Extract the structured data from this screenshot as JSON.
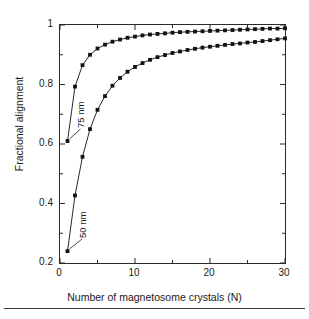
{
  "chart_data": {
    "type": "line",
    "title": "",
    "xlabel": "Number of magnetosome crystals (N)",
    "ylabel": "Fractional alignment",
    "xlim": [
      0,
      30
    ],
    "ylim": [
      0.2,
      1.0
    ],
    "grid": false,
    "legend_position": "inline-annotations",
    "xticks": [
      0,
      10,
      20,
      30
    ],
    "xtick_labels": [
      "0",
      "10",
      "20",
      "30"
    ],
    "xminor_ticks": [
      5,
      15,
      25
    ],
    "yticks": [
      0.2,
      0.4,
      0.6,
      0.8,
      1.0
    ],
    "ytick_labels": [
      "0.2",
      "0.4",
      "0.6",
      "0.8",
      "1"
    ],
    "yminor_ticks": [
      0.3,
      0.5,
      0.7,
      0.9
    ],
    "marker": "filled-square",
    "x": [
      1,
      2,
      3,
      4,
      5,
      6,
      7,
      8,
      9,
      10,
      11,
      12,
      13,
      14,
      15,
      16,
      17,
      18,
      19,
      20,
      21,
      22,
      23,
      24,
      25,
      26,
      27,
      28,
      29,
      30
    ],
    "series": [
      {
        "name": "75 nm",
        "annotation": "75 nm",
        "color": "#111111",
        "values": [
          0.61,
          0.793,
          0.865,
          0.9,
          0.921,
          0.934,
          0.944,
          0.951,
          0.957,
          0.961,
          0.965,
          0.968,
          0.97,
          0.972,
          0.974,
          0.976,
          0.977,
          0.978,
          0.979,
          0.98,
          0.981,
          0.982,
          0.983,
          0.984,
          0.985,
          0.986,
          0.987,
          0.988,
          0.988,
          0.989
        ]
      },
      {
        "name": "50 nm",
        "annotation": "50 nm",
        "color": "#111111",
        "values": [
          0.24,
          0.427,
          0.557,
          0.65,
          0.715,
          0.761,
          0.796,
          0.822,
          0.843,
          0.859,
          0.872,
          0.883,
          0.892,
          0.899,
          0.906,
          0.911,
          0.916,
          0.92,
          0.924,
          0.927,
          0.93,
          0.933,
          0.936,
          0.938,
          0.941,
          0.943,
          0.946,
          0.949,
          0.952,
          0.955
        ]
      }
    ]
  },
  "axes": {
    "ylabel": "Fractional alignment",
    "xlabel": "Number of magnetosome crystals (N)"
  }
}
